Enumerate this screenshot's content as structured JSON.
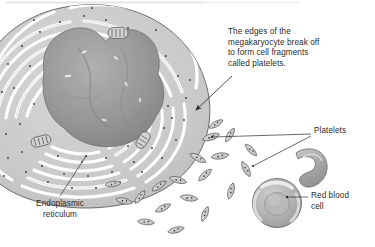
{
  "figure": {
    "width": 375,
    "height": 247,
    "background_color": "#ffffff",
    "top_border_color": "#e9e9e9"
  },
  "caption": {
    "text": "The edges of the\nmegakaryocyte break off\nto form cell fragments\ncalled platelets.",
    "lines": [
      "The edges of the",
      "megakaryocyte break off",
      "to form cell fragments",
      "called platelets."
    ]
  },
  "labels": {
    "platelets": "Platelets",
    "red_blood_cell": "Red blood\ncell",
    "red_blood_cell_lines": [
      "Red blood",
      "cell"
    ],
    "endoplasmic_reticulum": "Endoplasmic\nreticulum",
    "endoplasmic_reticulum_lines": [
      "Endoplasmic",
      "reticulum"
    ]
  },
  "colors": {
    "text": "#2b2b2b",
    "leader_line": "#3a3a3a",
    "cytoplasm": "#c9c9c9",
    "cytoplasm_light": "#d8d8d8",
    "er_lumen": "#ffffff",
    "nucleus": "#9b9b9b",
    "nucleus_shadow": "#8a8a8a",
    "nucleus_highlight": "#b5b5b5",
    "outline": "#555555",
    "ribosome": "#3c3c3c",
    "platelet_fill": "#cfcfcf",
    "platelet_outline": "#4a4a4a",
    "rbc_fill": "#b0b0b0",
    "rbc_highlight": "#e2e2e2",
    "rbc_outline": "#6a6a6a"
  },
  "structures": {
    "megakaryocyte": {
      "name": "megakaryocyte",
      "description": "Large cell with multi-lobed nucleus surrounded by concentric rough endoplasmic reticulum"
    },
    "nucleus": {
      "name": "multi-lobed nucleus"
    },
    "endoplasmic_reticulum": {
      "name": "endoplasmic reticulum",
      "description": "Concentric white channels studded with ribosomes"
    },
    "mitochondria": {
      "name": "mitochondria",
      "count": 3
    },
    "platelets": {
      "name": "platelets",
      "count": 19,
      "description": "Small spindle-shaped cell fragments budding off the megakaryocyte edge"
    },
    "red_blood_cells": {
      "name": "red blood cells",
      "count": 2,
      "views": [
        "edge view",
        "face view biconcave disc"
      ]
    }
  },
  "annotations": {
    "caption_arrow": {
      "name": "caption-arrow",
      "points_to": "megakaryocyte edge"
    },
    "platelets_leaders": {
      "name": "platelets-leader-lines",
      "branches": 2
    },
    "rbc_leader": {
      "name": "red-blood-cell-leader-line",
      "branches": 1
    },
    "er_leader": {
      "name": "endoplasmic-reticulum-leader-line",
      "branches": 1
    }
  }
}
